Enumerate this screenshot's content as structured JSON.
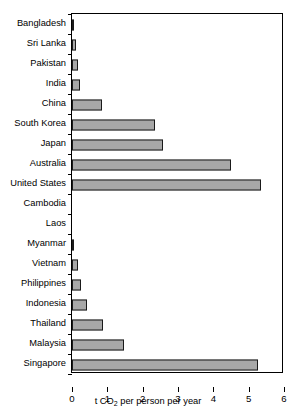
{
  "chart_data": {
    "type": "bar",
    "orientation": "horizontal",
    "title": "",
    "xlabel": "t CO2 per person per year",
    "xlabel_parts": {
      "pre": "t CO",
      "sub": "2",
      "post": " per person per year"
    },
    "ylabel": "",
    "xlim": [
      0,
      6
    ],
    "xticks": [
      0,
      1,
      2,
      3,
      4,
      5,
      6
    ],
    "xticklabels": [
      "0",
      "1",
      "2",
      "3",
      "4",
      "5",
      "6"
    ],
    "grid": false,
    "legend": null,
    "bar_color": "#a8a8a8",
    "bar_edge_color": "#1a1a1a",
    "categories": [
      "Bangladesh",
      "Sri Lanka",
      "Pakistan",
      "India",
      "China",
      "South Korea",
      "Japan",
      "Australia",
      "United States",
      "Cambodia",
      "Laos",
      "Myanmar",
      "Vietnam",
      "Philippines",
      "Indonesia",
      "Thailand",
      "Malaysia",
      "Singapore"
    ],
    "values": [
      0.06,
      0.11,
      0.17,
      0.23,
      0.85,
      2.35,
      2.58,
      4.5,
      5.35,
      0.0,
      0.0,
      0.06,
      0.17,
      0.25,
      0.42,
      0.88,
      1.47,
      5.27
    ]
  }
}
